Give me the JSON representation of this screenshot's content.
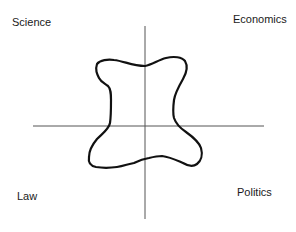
{
  "diagram": {
    "type": "quadrant-map-with-freeform-shape",
    "quadrants": {
      "top_left": "Science",
      "top_right": "Economics",
      "bottom_left": "Law",
      "bottom_right": "Politics"
    },
    "axes": {
      "vertical": {
        "x": 145,
        "y1": 26,
        "y2": 219,
        "color": "#555555"
      },
      "horizontal": {
        "y": 126,
        "x1": 33,
        "x2": 264,
        "color": "#555555"
      }
    },
    "shape": {
      "description": "hand-drawn closed blob spanning all four quadrants",
      "stroke_color": "#111111",
      "stroke_width": 2.2
    }
  }
}
